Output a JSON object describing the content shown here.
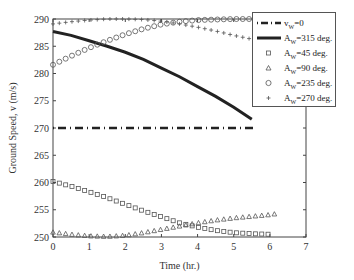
{
  "chart_data": {
    "type": "line",
    "title": "",
    "xlabel": "Time (hr.)",
    "ylabel": "Ground Speed, v (m/s)",
    "xlim": [
      0,
      7
    ],
    "ylim": [
      250,
      290
    ],
    "xticks": [
      0,
      1,
      2,
      3,
      4,
      5,
      6,
      7
    ],
    "yticks": [
      250,
      255,
      260,
      265,
      270,
      275,
      280,
      285,
      290
    ],
    "grid": false,
    "legend_position": "upper right",
    "series": [
      {
        "name": "v_W=0",
        "style": "dash-dot",
        "x": [
          0,
          5.6
        ],
        "y": [
          270,
          270
        ]
      },
      {
        "name": "A_W=315 deg.",
        "style": "solid-thick",
        "x": [
          0,
          0.5,
          1,
          1.5,
          2,
          2.5,
          3,
          3.5,
          4,
          4.5,
          5,
          5.5
        ],
        "y": [
          287.7,
          287.0,
          286.0,
          285.0,
          283.9,
          282.6,
          281.0,
          279.4,
          277.6,
          275.8,
          273.8,
          271.6
        ]
      },
      {
        "name": "A_W=45 deg.",
        "style": "square-markers",
        "x": [
          0,
          0.5,
          1,
          1.5,
          2,
          2.5,
          3,
          3.5,
          4,
          4.5,
          5,
          5.5,
          6
        ],
        "y": [
          260.2,
          259.3,
          258.3,
          257.2,
          256.0,
          254.8,
          253.7,
          252.6,
          251.8,
          251.2,
          250.8,
          250.6,
          250.5
        ]
      },
      {
        "name": "A_W=90 deg.",
        "style": "triangle-markers",
        "x": [
          0,
          0.5,
          1,
          1.5,
          2,
          2.5,
          3,
          3.5,
          4,
          4.5,
          5,
          5.5,
          6,
          6.2
        ],
        "y": [
          250.9,
          250.5,
          250.2,
          250.1,
          250.3,
          250.8,
          251.4,
          252.0,
          252.6,
          253.1,
          253.5,
          253.8,
          254.1,
          254.3
        ]
      },
      {
        "name": "A_W=235 deg.",
        "style": "circle-markers",
        "x": [
          0,
          0.5,
          1,
          1.5,
          2,
          2.5,
          3,
          3.5,
          4,
          4.5,
          5,
          5.5,
          6,
          6.2
        ],
        "y": [
          281.6,
          283.2,
          284.7,
          286.0,
          287.2,
          288.2,
          289.0,
          289.5,
          289.8,
          289.9,
          290.0,
          290.0,
          290.0,
          290.0
        ]
      },
      {
        "name": "A_W=270 deg.",
        "style": "plus-markers",
        "x": [
          0,
          0.5,
          1,
          1.5,
          2,
          2.5,
          3,
          3.5,
          4,
          4.5,
          5,
          5.5,
          6,
          6.2
        ],
        "y": [
          289.1,
          289.5,
          289.8,
          290.0,
          290.0,
          289.9,
          289.6,
          289.1,
          288.5,
          287.8,
          287.0,
          286.3,
          285.6,
          285.3
        ]
      }
    ]
  },
  "legend": {
    "items": [
      {
        "main": "v",
        "sub": "W",
        "rest": "=0"
      },
      {
        "main": "A",
        "sub": "W",
        "rest": "=315 deg."
      },
      {
        "main": "A",
        "sub": "W",
        "rest": "=45 deg."
      },
      {
        "main": "A",
        "sub": "W",
        "rest": "=90 deg."
      },
      {
        "main": "A",
        "sub": "W",
        "rest": "=235 deg."
      },
      {
        "main": "A",
        "sub": "W",
        "rest": "=270 deg."
      }
    ]
  },
  "colors": {
    "axis": "#444444",
    "series": "#222222",
    "marker": "#555555"
  }
}
